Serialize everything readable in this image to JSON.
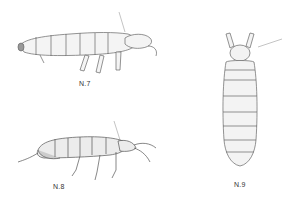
{
  "figure": {
    "specimens": [
      {
        "id": "n7",
        "label": "N.7",
        "view": "lateral"
      },
      {
        "id": "n8",
        "label": "N.8",
        "view": "lateral"
      },
      {
        "id": "n9",
        "label": "N.9",
        "view": "dorsal"
      }
    ]
  },
  "colors": {
    "ink": "#555555",
    "body_fill": "#f2f2f2",
    "shade": "#cfcfcf"
  }
}
